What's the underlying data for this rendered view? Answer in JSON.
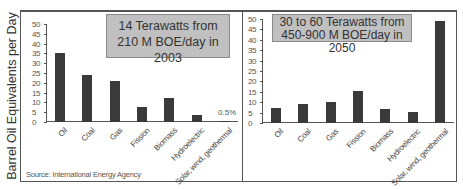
{
  "ylabel": "Barrel Oil Equivalents per Day",
  "source": "Source: International Energy Agency",
  "chart_data": [
    {
      "type": "bar",
      "title": "14 Terawatts from 210 M BOE/day in 2003",
      "callout_lines": [
        "14 Terawatts from",
        "210 M BOE/day in 2003"
      ],
      "xlabel": "",
      "ylabel": "Barrel Oil Equivalents per Day",
      "ylim": [
        0,
        50
      ],
      "yticks": [
        "0",
        "5",
        "10",
        "15",
        "20",
        "25",
        "30",
        "35",
        "40",
        "45",
        "50"
      ],
      "categories": [
        "Oil",
        "Coal",
        "Gas",
        "Fission",
        "Biomass",
        "Hydroelectric",
        "Solar, wind, geothermal"
      ],
      "values": [
        35,
        24,
        21,
        7.5,
        12,
        3.5,
        0.5
      ],
      "annotations": [
        {
          "category": "Solar, wind, geothermal",
          "text": "0.5%"
        }
      ],
      "grid": false
    },
    {
      "type": "bar",
      "title": "30 to 60 Terawatts from 450-900 M BOE/day in 2050",
      "callout_lines": [
        "30 to 60 Terawatts from",
        "450-900 M BOE/day in 2050"
      ],
      "xlabel": "",
      "ylabel": "Barrel Oil Equivalents per Day",
      "ylim": [
        0,
        50
      ],
      "yticks": [
        "0",
        "5",
        "10",
        "15",
        "20",
        "25",
        "30",
        "35",
        "40",
        "45",
        "50"
      ],
      "categories": [
        "Oil",
        "Coal",
        "Gas",
        "Fission",
        "Biomass",
        "Hydroelectric",
        "Solar, wind, geothermal"
      ],
      "values": [
        7,
        9,
        10,
        15.5,
        6.5,
        5.5,
        49
      ],
      "grid": false
    }
  ]
}
